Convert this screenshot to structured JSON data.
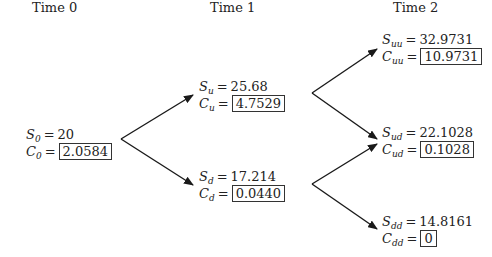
{
  "headers": [
    "Time 0",
    "Time 1",
    "Time 2"
  ],
  "nodes": {
    "root": {
      "s_sub": "0",
      "s_val": "20",
      "c_sub": "0",
      "c_val": "2.0584"
    },
    "u": {
      "s_sub": "u",
      "s_val": "25.68",
      "c_sub": "u",
      "c_val": "4.7529"
    },
    "d": {
      "s_sub": "d",
      "s_val": "17.214",
      "c_sub": "d",
      "c_val": "0.0440"
    },
    "uu": {
      "s_sub": "uu",
      "s_val": "32.9731",
      "c_sub": "uu",
      "c_val": "10.9731"
    },
    "ud": {
      "s_sub": "ud",
      "s_val": "22.1028",
      "c_sub": "ud",
      "c_val": "0.1028"
    },
    "dd": {
      "s_sub": "dd",
      "s_val": "14.8161",
      "c_sub": "dd",
      "c_val": "0"
    }
  },
  "symbols": {
    "s": "S",
    "c": "C",
    "eq": "="
  },
  "colors": {
    "line": "#1a1a1a",
    "text": "#222222",
    "box_border": "#333333"
  }
}
